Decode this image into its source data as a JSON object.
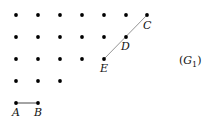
{
  "diagram": {
    "caption": "(G",
    "caption_subscript": "1",
    "caption_close": ")",
    "dot_rows": [
      {
        "y": 15,
        "xs": [
          16,
          38,
          60,
          82,
          104,
          126,
          147
        ]
      },
      {
        "y": 37,
        "xs": [
          16,
          38,
          60,
          82,
          104,
          126
        ]
      },
      {
        "y": 59,
        "xs": [
          16,
          38,
          60,
          82,
          104
        ]
      },
      {
        "y": 81,
        "xs": [
          16,
          38,
          60
        ]
      },
      {
        "y": 103,
        "xs": [
          16,
          38
        ]
      }
    ],
    "points": {
      "A": {
        "label": "A",
        "x": 16,
        "y": 103
      },
      "B": {
        "label": "B",
        "x": 38,
        "y": 103
      },
      "C": {
        "label": "C",
        "x": 147,
        "y": 15
      },
      "D": {
        "label": "D",
        "x": 126,
        "y": 37
      },
      "E": {
        "label": "E",
        "x": 104,
        "y": 59
      }
    },
    "segments": [
      {
        "from": "A",
        "to": "B",
        "color": "#333333"
      },
      {
        "from": "E",
        "to": "C",
        "color": "#888888"
      }
    ],
    "dot_color": "#000000"
  }
}
